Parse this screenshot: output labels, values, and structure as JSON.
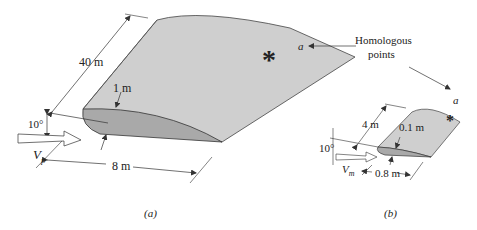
{
  "figure": {
    "panel_a": {
      "caption": "(a)",
      "span": "40 m",
      "thickness": "1 m",
      "chord": "8 m",
      "angle": "10°",
      "velocity_symbol": "V",
      "velocity_subscript": "p",
      "marker": "*"
    },
    "panel_b": {
      "caption": "(b)",
      "span": "4 m",
      "thickness": "0.1 m",
      "chord": "0.8 m",
      "angle": "10°",
      "velocity_symbol": "V",
      "velocity_subscript": "m",
      "marker": "*"
    },
    "annotation": {
      "line1": "Homologous",
      "line2": "points",
      "point_label_a": "a",
      "point_label_b": "a"
    },
    "colors": {
      "top_surface": "#cfcfcf",
      "section_face": "#a9a9a9",
      "line": "#333333"
    }
  }
}
